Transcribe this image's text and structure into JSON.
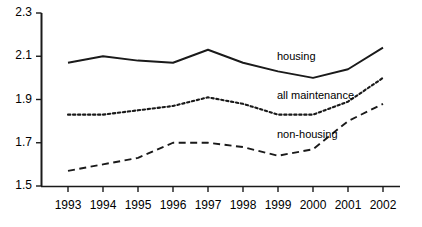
{
  "chart_data": {
    "type": "line",
    "title": "",
    "xlabel": "",
    "ylabel": "",
    "categories": [
      "1993",
      "1994",
      "1995",
      "1996",
      "1997",
      "1998",
      "1999",
      "2000",
      "2001",
      "2002"
    ],
    "x": [
      1993,
      1994,
      1995,
      1996,
      1997,
      1998,
      1999,
      2000,
      2001,
      2002
    ],
    "ylim": [
      1.5,
      2.3
    ],
    "yticks": [
      "1.5",
      "1.7",
      "1.9",
      "2.1",
      "2.3"
    ],
    "ytick_values": [
      1.5,
      1.7,
      1.9,
      2.1,
      2.3
    ],
    "grid": false,
    "legend_position": "inline-right",
    "series": [
      {
        "name": "housing",
        "style": "solid",
        "color": "#1a1a1a",
        "values": [
          2.07,
          2.1,
          2.08,
          2.07,
          2.13,
          2.07,
          2.03,
          2.0,
          2.04,
          2.14
        ],
        "label": "housing"
      },
      {
        "name": "all maintenance",
        "style": "dotted",
        "color": "#1a1a1a",
        "values": [
          1.83,
          1.83,
          1.85,
          1.87,
          1.91,
          1.88,
          1.83,
          1.83,
          1.89,
          2.0
        ],
        "label": "all maintenance"
      },
      {
        "name": "non-housing",
        "style": "dashed",
        "color": "#1a1a1a",
        "values": [
          1.57,
          1.6,
          1.63,
          1.7,
          1.7,
          1.68,
          1.64,
          1.67,
          1.8,
          1.88
        ],
        "label": "non-housing"
      }
    ],
    "annotations": [
      {
        "text": "housing",
        "x": 277,
        "y": 50
      },
      {
        "text": "all maintenance",
        "x": 277,
        "y": 89
      },
      {
        "text": "non-housing",
        "x": 277,
        "y": 128
      }
    ]
  },
  "axes": {
    "y_labels": [
      "2.3",
      "2.1",
      "1.9",
      "1.7",
      "1.5"
    ],
    "x_labels": [
      "1993",
      "1994",
      "1995",
      "1996",
      "1997",
      "1998",
      "1999",
      "2000",
      "2001",
      "2002"
    ]
  }
}
